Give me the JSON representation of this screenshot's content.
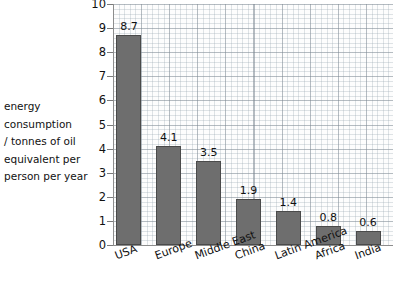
{
  "chart_data": {
    "type": "bar",
    "title": "",
    "xlabel": "",
    "ylabel": "energy consumption / tonnes of oil equivalent per person per year",
    "ylabel_lines": [
      "energy",
      "consumption",
      "/ tonnes of oil",
      "equivalent per",
      "person per year"
    ],
    "categories": [
      "USA",
      "Europe",
      "Middle East",
      "China",
      "Latin America",
      "Africa",
      "India"
    ],
    "values": [
      8.7,
      4.1,
      3.5,
      1.9,
      1.4,
      0.8,
      0.6
    ],
    "value_labels": [
      "8.7",
      "4.1",
      "3.5",
      "1.9",
      "1.4",
      "0.8",
      "0.6"
    ],
    "ylim": [
      0,
      10
    ],
    "ytick_labels": [
      "0",
      "1",
      "2",
      "3",
      "4",
      "5",
      "6",
      "7",
      "8",
      "9",
      "10"
    ],
    "ytick_values": [
      0,
      1,
      2,
      3,
      4,
      5,
      6,
      7,
      8,
      9,
      10
    ],
    "grid": true,
    "grid_style": "graph-paper",
    "legend": "none",
    "bar_color": "#6e6e6e",
    "bar_edge_color": "#4a4a4a",
    "axis_color": "#8d8d8d",
    "background_color": "#ffffff",
    "plot_background_color": "#fdfdfd",
    "x_tick_label_rotation": -20
  }
}
